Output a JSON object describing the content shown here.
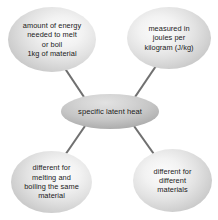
{
  "diagram": {
    "type": "concept-map",
    "title": "specific latent heat",
    "background_color": "#ffffff",
    "connector_color": "#707070",
    "center_node": {
      "id": "specific-latent-heat",
      "label": "specific latent heat"
    },
    "satellite_nodes": [
      {
        "id": "amount-of-energy",
        "position": "top-left",
        "label": "amount of energy\nneeded to melt\nor boil\n1kg of material"
      },
      {
        "id": "measured-in-joules-per-kilogram",
        "position": "top-right",
        "label": "measured in\njoules per\nkilogram (J/kg)"
      },
      {
        "id": "different-for-melting-and-boiling",
        "position": "bottom-left",
        "label": "different for\nmelting and\nboiling the same\nmaterial"
      },
      {
        "id": "different-for-different-materials",
        "position": "bottom-right",
        "label": "different for\ndifferent\nmaterials"
      }
    ],
    "connectors": [
      {
        "id": "connector-center-top-left",
        "from": "specific-latent-heat",
        "to": "amount-of-energy"
      },
      {
        "id": "connector-center-top-right",
        "from": "specific-latent-heat",
        "to": "measured-in-joules-per-kilogram"
      },
      {
        "id": "connector-center-bottom-left",
        "from": "specific-latent-heat",
        "to": "different-for-melting-and-boiling"
      },
      {
        "id": "connector-center-bottom-right",
        "from": "specific-latent-heat",
        "to": "different-for-different-materials"
      }
    ]
  }
}
